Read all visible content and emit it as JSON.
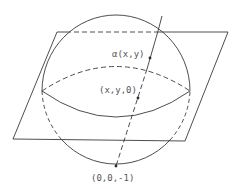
{
  "diagram": {
    "colors": {
      "stroke": "#3a3a3a",
      "text": "#555555",
      "background": "#ffffff"
    },
    "labels": {
      "alpha_point": "α(x,y)",
      "plane_point": "(x,y,0)",
      "south_pole": "(0,0,-1)"
    }
  }
}
